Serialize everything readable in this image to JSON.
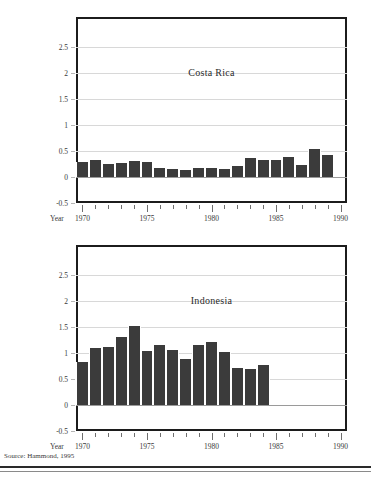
{
  "figure": {
    "source_note": "Source: Hammond, 1995",
    "year_axis_word": "Year",
    "bar_color": "#3b3b3b",
    "frame_color": "#1c1c1c",
    "grid_color": "#d8d8d8"
  },
  "chart_data": [
    {
      "type": "bar",
      "title": "Costa Rica",
      "xlabel": "Year",
      "ylabel": "",
      "ylim": [
        -0.5,
        2.65
      ],
      "xlim": [
        1969.5,
        1990.5
      ],
      "yticks": [
        "2.5",
        "2",
        "1.5",
        "1",
        "0.5",
        "0",
        "-0.5"
      ],
      "ytick_values": [
        2.5,
        2,
        1.5,
        1,
        0.5,
        0,
        -0.5
      ],
      "xticks": [
        "1970",
        "1975",
        "1980",
        "1985",
        "1990"
      ],
      "xtick_values": [
        1970,
        1975,
        1980,
        1985,
        1990
      ],
      "grid": true,
      "legend": "none",
      "categories": [
        1970,
        1971,
        1972,
        1973,
        1974,
        1975,
        1976,
        1977,
        1978,
        1979,
        1980,
        1981,
        1982,
        1983,
        1984,
        1985,
        1986,
        1987,
        1988,
        1989
      ],
      "values": [
        0.28,
        0.32,
        0.25,
        0.27,
        0.3,
        0.29,
        0.17,
        0.16,
        0.14,
        0.17,
        0.18,
        0.15,
        0.21,
        0.37,
        0.33,
        0.33,
        0.39,
        0.24,
        0.54,
        0.43
      ]
    },
    {
      "type": "bar",
      "title": "Indonesia",
      "xlabel": "Year",
      "ylabel": "",
      "ylim": [
        -0.5,
        2.65
      ],
      "xlim": [
        1969.5,
        1990.5
      ],
      "yticks": [
        "2.5",
        "2",
        "1.5",
        "1",
        "0.5",
        "0",
        "-0.5"
      ],
      "ytick_values": [
        2.5,
        2,
        1.5,
        1,
        0.5,
        0,
        -0.5
      ],
      "xticks": [
        "1970",
        "1975",
        "1980",
        "1985",
        "1990"
      ],
      "xtick_values": [
        1970,
        1975,
        1980,
        1985,
        1990
      ],
      "grid": true,
      "legend": "none",
      "categories": [
        1970,
        1971,
        1972,
        1973,
        1974,
        1975,
        1976,
        1977,
        1978,
        1979,
        1980,
        1981,
        1982,
        1983,
        1984
      ],
      "values": [
        0.82,
        1.09,
        1.12,
        1.3,
        1.51,
        1.04,
        1.15,
        1.06,
        0.88,
        1.15,
        1.22,
        1.02,
        0.72,
        0.7,
        0.77
      ]
    }
  ]
}
